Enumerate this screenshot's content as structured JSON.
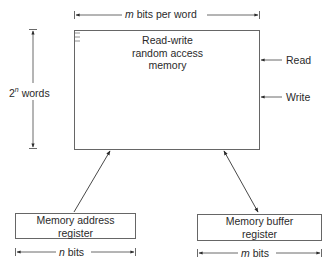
{
  "diagram": {
    "memory": {
      "title_line1": "Read-write",
      "title_line2": "random access",
      "title_line3": "memory"
    },
    "width_label": {
      "var": "m",
      "text": " bits per word"
    },
    "height_label": {
      "base": "2",
      "exp": "n",
      "text": " words"
    },
    "controls": [
      {
        "label": "Read"
      },
      {
        "label": "Write"
      }
    ],
    "address_register": {
      "line1": "Memory address",
      "line2": "register",
      "width_var": "n",
      "width_text": " bits"
    },
    "buffer_register": {
      "line1": "Memory buffer",
      "line2": "register",
      "width_var": "m",
      "width_text": " bits"
    },
    "colors": {
      "line": "#3a3a3a",
      "box": "#555555",
      "text": "#2a2a2a"
    }
  }
}
